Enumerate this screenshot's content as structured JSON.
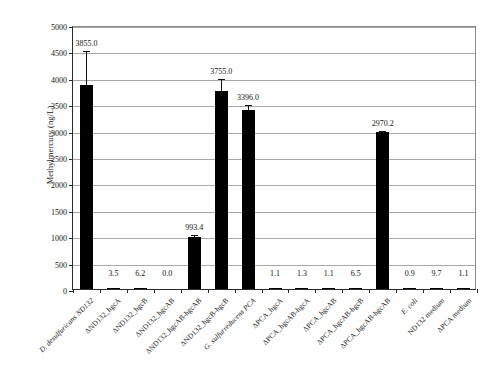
{
  "chart_data": {
    "type": "bar",
    "title": "",
    "xlabel": "",
    "ylabel": "Methylmercury (ng/L)",
    "ylim": [
      0,
      5000
    ],
    "ytick_step": 500,
    "yticks": [
      "0",
      "500",
      "1000",
      "1500",
      "2000",
      "2500",
      "3000",
      "3500",
      "4000",
      "4500",
      "5000"
    ],
    "grid": true,
    "legend": "none",
    "categories": [
      "D. desulfuricans ND132",
      "ΔND132_hgcA",
      "ΔND132_hgcB",
      "ΔND132_hgcAB",
      "ΔND132_hgcAB-hgcAB",
      "ΔND132_hgcB-hgcB",
      "G. sulfurreducens PCA",
      "ΔPCA_hgcA",
      "ΔPCA_hgcAB-hgcA",
      "ΔPCA_hgcAB",
      "ΔPCA_hgcAB-hgcB",
      "ΔPCA_hgcAB-hgcAB",
      "E. coli",
      "ND132 medium",
      "ΔPCA medium"
    ],
    "categories_italic": [
      true,
      false,
      false,
      false,
      false,
      false,
      true,
      false,
      false,
      false,
      false,
      false,
      true,
      false,
      false
    ],
    "values": [
      3855.0,
      3.5,
      6.2,
      0.0,
      993.4,
      3755.0,
      3396.0,
      1.1,
      1.3,
      1.1,
      6.5,
      2970.2,
      0.9,
      9.7,
      1.1
    ],
    "value_labels": [
      "3855.0",
      "3.5",
      "6.2",
      "0.0",
      "993.4",
      "3755.0",
      "3396.0",
      "1.1",
      "1.3",
      "1.1",
      "6.5",
      "2970.2",
      "0.9",
      "9.7",
      "1.1"
    ],
    "errors": [
      683.0,
      0.0,
      0.0,
      0.0,
      60.0,
      252.0,
      120.0,
      0.0,
      0.0,
      0.0,
      0.0,
      55.0,
      0.0,
      0.0,
      0.0
    ],
    "bar_color": "#000000",
    "axis_color": "#2b2b2b",
    "grid_color": "#a8a8a8",
    "background": "#ffffff"
  }
}
